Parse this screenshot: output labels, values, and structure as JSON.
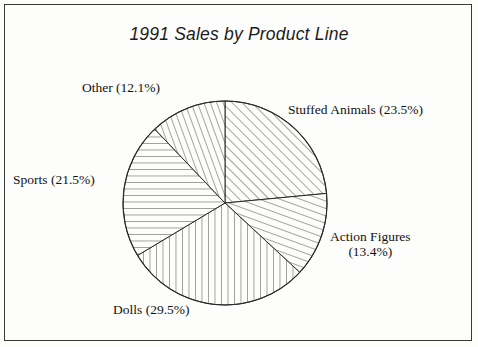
{
  "page": {
    "background_color": "#fdfdfb",
    "frame_color": "#3a3a3a",
    "ink_color": "#131313"
  },
  "chart_data": {
    "type": "pie",
    "title": "1991 Sales by Product Line",
    "xlabel": "",
    "ylabel": "",
    "legend_position": "none",
    "labels_inline": true,
    "start_angle_deg": 0,
    "direction": "clockwise",
    "categories": [
      "Stuffed Animals",
      "Action Figures",
      "Dolls",
      "Sports",
      "Other"
    ],
    "values": [
      23.5,
      13.4,
      29.5,
      21.5,
      12.1
    ],
    "value_unit": "%",
    "slices": [
      {
        "name": "Stuffed Animals",
        "percent": 23.5,
        "label": "Stuffed Animals (23.5%)",
        "hatch": "diagonal-up",
        "start_deg": 0.0,
        "end_deg": 84.6
      },
      {
        "name": "Action Figures",
        "percent": 13.4,
        "label_line1": "Action Figures",
        "label_line2": "(13.4%)",
        "label": "Action Figures (13.4%)",
        "hatch": "diagonal-down",
        "start_deg": 84.6,
        "end_deg": 132.84
      },
      {
        "name": "Dolls",
        "percent": 29.5,
        "label": "Dolls (29.5%)",
        "hatch": "vertical",
        "start_deg": 132.84,
        "end_deg": 239.04
      },
      {
        "name": "Sports",
        "percent": 21.5,
        "label": "Sports (21.5%)",
        "hatch": "horizontal",
        "start_deg": 239.04,
        "end_deg": 316.44
      },
      {
        "name": "Other",
        "percent": 12.1,
        "label": "Other (12.1%)",
        "hatch": "steep-diagonal",
        "start_deg": 316.44,
        "end_deg": 360.0
      }
    ],
    "geometry": {
      "center_x": 225,
      "center_y": 203,
      "radius": 102
    }
  }
}
